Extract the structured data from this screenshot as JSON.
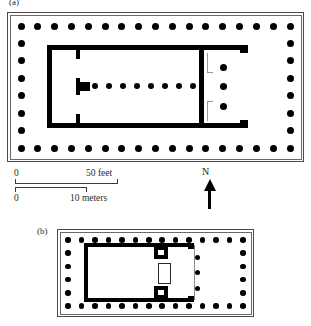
{
  "figure": {
    "panels": [
      {
        "id": "a",
        "label": "(a)",
        "description": "peripteral temple plan, large"
      },
      {
        "id": "b",
        "label": "(b)",
        "description": "peripteral temple plan, small"
      }
    ]
  },
  "scale_bar": {
    "feet": {
      "start_label": "0",
      "end_label": "50  feet"
    },
    "meters": {
      "start_label": "0",
      "end_label": "10  meters"
    }
  },
  "north_arrow": {
    "label": "N",
    "direction": "up"
  },
  "plan_a": {
    "peristyle": {
      "columns_top": 17,
      "columns_bottom": 17,
      "columns_left": 8,
      "columns_right": 8
    },
    "interior": {
      "naos_colonnade_count": 8,
      "east_porch_columns": 3,
      "cult_base": "T-shaped statue base at west end"
    }
  },
  "plan_b": {
    "peristyle": {
      "columns_top": 14,
      "columns_bottom": 14,
      "columns_left": 6,
      "columns_right": 6
    },
    "interior": {
      "anta_detail": "meander/key spiral antae",
      "east_porch_columns": 3
    }
  },
  "colors": {
    "wall": "#000000",
    "column": "#000000",
    "crepidoma_line": "#4a4a4a",
    "background": "#ffffff",
    "text": "#1a1a1a"
  }
}
